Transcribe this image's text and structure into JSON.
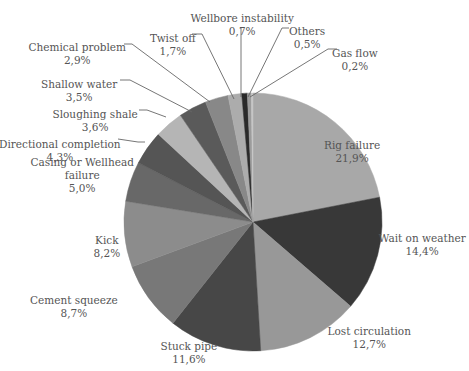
{
  "chart_data": {
    "type": "pie",
    "title": "",
    "start_angle_deg": 0,
    "direction": "clockwise",
    "center": [
      253,
      222
    ],
    "radius": 129,
    "slices": [
      {
        "label": "Rig failure",
        "value": 21.9,
        "display": "21,9%",
        "color": "#a8a8a8",
        "lx": 352,
        "ly": 146,
        "lines": [
          "Rig failure"
        ]
      },
      {
        "label": "Wait on weather",
        "value": 14.4,
        "display": "14,4%",
        "color": "#383838",
        "lx": 422,
        "ly": 239,
        "lines": [
          "Wait on weather"
        ]
      },
      {
        "label": "Lost circulation",
        "value": 12.7,
        "display": "12,7%",
        "color": "#989898",
        "lx": 369,
        "ly": 332,
        "lines": [
          "Lost circulation"
        ]
      },
      {
        "label": "Stuck pipe",
        "value": 11.6,
        "display": "11,6%",
        "color": "#474747",
        "lx": 189,
        "ly": 347,
        "lines": [
          "Stuck pipe"
        ]
      },
      {
        "label": "Cement squeeze",
        "value": 8.7,
        "display": "8,7%",
        "color": "#787878",
        "lx": 74,
        "ly": 301,
        "lines": [
          "Cement squeeze"
        ]
      },
      {
        "label": "Kick",
        "value": 8.2,
        "display": "8,2%",
        "color": "#8c8c8c",
        "lx": 107,
        "ly": 241,
        "lines": [
          "Kick"
        ]
      },
      {
        "label": "Casing or Wellhead failure",
        "value": 5.0,
        "display": "5,0%",
        "color": "#686868",
        "lx": 82,
        "ly": 175,
        "lines": [
          "Casing or Wellhead",
          "failure"
        ]
      },
      {
        "label": "Directional completion",
        "value": 4.3,
        "display": "4,3%",
        "color": "#555555",
        "lx": 60,
        "ly": 145,
        "lines": [
          "Directional completion"
        ]
      },
      {
        "label": "Sloughing shale",
        "value": 3.6,
        "display": "3,6%",
        "color": "#b5b5b5",
        "lx": 95,
        "ly": 115,
        "lines": [
          "Sloughing shale"
        ]
      },
      {
        "label": "Shallow water",
        "value": 3.5,
        "display": "3,5%",
        "color": "#5a5a5a",
        "lx": 79,
        "ly": 85,
        "lines": [
          "Shallow water"
        ]
      },
      {
        "label": "Chemical problem",
        "value": 2.9,
        "display": "2,9%",
        "color": "#888888",
        "lx": 77,
        "ly": 48,
        "lines": [
          "Chemical problem"
        ]
      },
      {
        "label": "Twist off",
        "value": 1.7,
        "display": "1,7%",
        "color": "#acacac",
        "lx": 173,
        "ly": 39,
        "lines": [
          "Twist off"
        ]
      },
      {
        "label": "Wellbore instability",
        "value": 0.7,
        "display": "0,7%",
        "color": "#2a2a2a",
        "lx": 242,
        "ly": 19,
        "lines": [
          "Wellbore instability"
        ]
      },
      {
        "label": "Others",
        "value": 0.5,
        "display": "0,5%",
        "color": "#9c9c9c",
        "lx": 307,
        "ly": 32,
        "lines": [
          "Others"
        ]
      },
      {
        "label": "Gas flow",
        "value": 0.2,
        "display": "0,2%",
        "color": "#c6c6c6",
        "lx": 355,
        "ly": 54,
        "lines": [
          "Gas flow"
        ]
      }
    ],
    "leaders": [
      {
        "label": "Shallow water",
        "points": [
          [
            120,
            80
          ],
          [
            130,
            80
          ],
          [
            192,
            112
          ]
        ]
      },
      {
        "label": "Chemical problem",
        "points": [
          [
            124,
            44
          ],
          [
            132,
            44
          ],
          [
            210,
            102
          ]
        ]
      },
      {
        "label": "Twist off",
        "points": [
          [
            192,
            34
          ],
          [
            202,
            34
          ],
          [
            234,
            99
          ]
        ]
      },
      {
        "label": "Wellbore instability",
        "points": [
          [
            241,
            28
          ],
          [
            241,
            97
          ]
        ]
      },
      {
        "label": "Others",
        "points": [
          [
            289,
            28
          ],
          [
            282,
            28
          ],
          [
            248,
            97
          ]
        ]
      },
      {
        "label": "Gas flow",
        "points": [
          [
            337,
            49
          ],
          [
            328,
            49
          ],
          [
            250,
            97
          ]
        ]
      },
      {
        "label": "Sloughing shale",
        "points": [
          [
            139,
            110
          ],
          [
            147,
            110
          ],
          [
            166,
            117
          ]
        ]
      },
      {
        "label": "Directional completion",
        "points": [
          [
            118,
            139
          ],
          [
            138,
            142
          ],
          [
            145,
            142
          ]
        ]
      }
    ],
    "legend": "none",
    "grid": false
  }
}
